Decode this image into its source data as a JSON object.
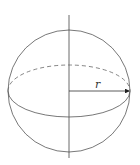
{
  "diagram": {
    "type": "sphere",
    "label_radius": "r",
    "stroke_color": "#555555",
    "elements": [
      "outer-circle",
      "vertical-axis",
      "equator-front-solid",
      "equator-back-dashed",
      "radius-arrow"
    ]
  }
}
